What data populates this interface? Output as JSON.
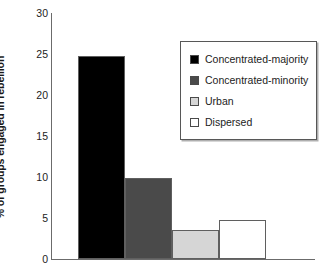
{
  "chart_data": {
    "type": "bar",
    "title": "",
    "xlabel": "",
    "ylabel": "% of groups engaged in rebellion",
    "categories": [
      "Concentrated-majority",
      "Concentrated-minority",
      "Urban",
      "Dispersed"
    ],
    "values": [
      24.7,
      9.9,
      3.5,
      4.7
    ],
    "ylim": [
      0,
      30
    ],
    "yticks": [
      0,
      5,
      10,
      15,
      20,
      25,
      30
    ],
    "ytick_labels": [
      "0",
      "5",
      "10",
      "15",
      "20",
      "25",
      "30"
    ],
    "grid": false,
    "legend_position": "upper-right",
    "bar_colors": [
      "#000000",
      "#4a4a4a",
      "#d6d6d6",
      "#ffffff"
    ],
    "bar_edge_color": "#5f5f5f",
    "axis_color": "#6b6b6b",
    "legend": [
      {
        "label": "Concentrated-majority",
        "color": "#000000"
      },
      {
        "label": "Concentrated-minority",
        "color": "#4a4a4a"
      },
      {
        "label": "Urban",
        "color": "#d6d6d6"
      },
      {
        "label": "Dispersed",
        "color": "#ffffff"
      }
    ]
  }
}
